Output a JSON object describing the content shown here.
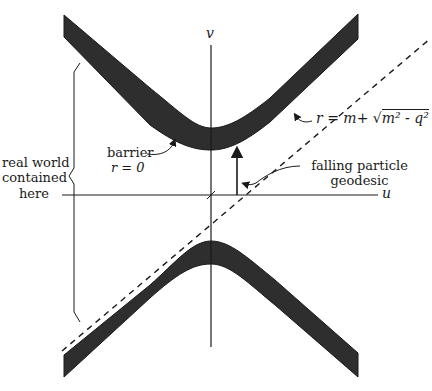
{
  "diagram": {
    "type": "spacetime-diagram",
    "axes": {
      "vertical_label": "v",
      "horizontal_label": "u"
    },
    "labels": {
      "barrier_line1": "barrier",
      "barrier_line2": "r = 0",
      "horizon_r": "r",
      "horizon_eq": "=",
      "horizon_m": "m",
      "horizon_plus": "+",
      "horizon_sqrt": "√",
      "horizon_radicand": "m² - q²",
      "falling_line1": "falling particle",
      "falling_line2": "geodesic",
      "real_world_line1": "real world",
      "real_world_line2": "contained",
      "real_world_line3": "here"
    },
    "colors": {
      "ink": "#1a1a1a",
      "band_fill": "#2e2e2e",
      "background": "#ffffff"
    }
  }
}
